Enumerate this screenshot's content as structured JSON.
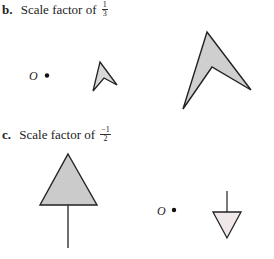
{
  "sections": [
    {
      "letter": "b.",
      "text": "Scale factor of",
      "fraction": {
        "numerator": "1",
        "denominator": "3"
      },
      "center_label": "O"
    },
    {
      "letter": "c.",
      "text": "Scale factor of",
      "fraction": {
        "numerator": "−1",
        "denominator": "2"
      },
      "center_label": "O"
    }
  ],
  "colors": {
    "stroke": "#222222",
    "fill_gray": "#cfcfcf",
    "fill_light": "#f0e8e8"
  }
}
